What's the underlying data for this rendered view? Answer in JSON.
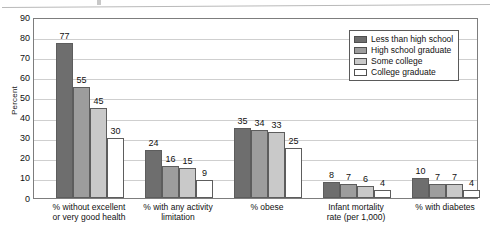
{
  "chart_data": {
    "type": "bar",
    "title": "",
    "subtitle": "",
    "xlabel": "",
    "ylabel": "Percent",
    "ylim": [
      0,
      90
    ],
    "ytick_step": 10,
    "yticks": [
      0,
      10,
      20,
      30,
      40,
      50,
      60,
      70,
      80,
      90
    ],
    "ytick_labels": [
      "0",
      "10",
      "20",
      "30",
      "40",
      "50",
      "60",
      "70",
      "80",
      "90"
    ],
    "grid": true,
    "grid_axis": "y",
    "legend_position": "upper right",
    "value_labels": true,
    "categories": [
      "% without excellent\nor very good health",
      "% with any activity\nlimitation",
      "% obese",
      "Infant mortality\nrate (per 1,000)",
      "% with diabetes"
    ],
    "category_lines": [
      [
        "% without excellent",
        "or very good health"
      ],
      [
        "% with any activity",
        "limitation"
      ],
      [
        "% obese"
      ],
      [
        "Infant mortality",
        "rate (per 1,000)"
      ],
      [
        "% with diabetes"
      ]
    ],
    "series": [
      {
        "name": "Less than high school",
        "color": "#6e6e6e",
        "values": [
          77,
          24,
          35,
          8,
          10
        ]
      },
      {
        "name": "High school graduate",
        "color": "#9d9d9d",
        "values": [
          55,
          16,
          34,
          7,
          7
        ]
      },
      {
        "name": "Some college",
        "color": "#c9c9c9",
        "values": [
          45,
          15,
          33,
          6,
          7
        ]
      },
      {
        "name": "College graduate",
        "color": "#ffffff",
        "values": [
          30,
          9,
          25,
          4,
          4
        ]
      }
    ]
  },
  "legend": {
    "items": [
      {
        "label": "Less than high school",
        "color": "#6e6e6e"
      },
      {
        "label": "High school graduate",
        "color": "#9d9d9d"
      },
      {
        "label": "Some college",
        "color": "#c9c9c9"
      },
      {
        "label": "College graduate",
        "color": "#ffffff"
      }
    ]
  },
  "colors": {
    "axis": "#7d7d7d",
    "grid": "#cfcfcf",
    "bar_outline": "#5d5d5d",
    "text": "#111111"
  }
}
